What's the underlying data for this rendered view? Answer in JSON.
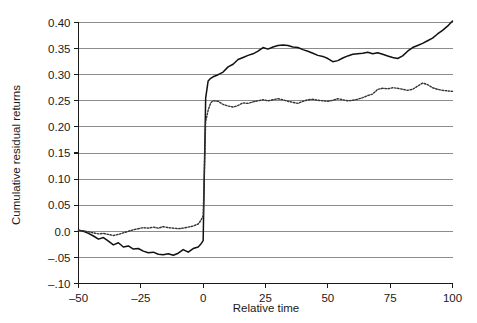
{
  "chart_data": {
    "type": "line",
    "title": "",
    "xlabel": "Relative time",
    "ylabel": "Cumulative residual returns",
    "xlim": [
      -50,
      100
    ],
    "ylim": [
      -0.1,
      0.4
    ],
    "xticks": [
      -50,
      -25,
      0,
      25,
      50,
      75,
      100
    ],
    "xtick_labels": [
      "–50",
      "–25",
      "0",
      "25",
      "50",
      "75",
      "100"
    ],
    "yticks": [
      -0.1,
      -0.05,
      0.0,
      0.05,
      0.1,
      0.15,
      0.2,
      0.25,
      0.3,
      0.35,
      0.4
    ],
    "ytick_labels": [
      "–.10",
      "–.05",
      "0.0",
      "0.05",
      "0.10",
      "0.15",
      "0.20",
      "0.25",
      "0.30",
      "0.35",
      "0.40"
    ],
    "grid": "horizontal-and-vertical-at-minus-50",
    "legend": "none",
    "accent_gridline_color": "#8c8c8c",
    "series": [
      {
        "name": "solid-series",
        "style": "solid",
        "color": "#111111",
        "x": [
          -50,
          -48,
          -46,
          -44,
          -42,
          -40,
          -38,
          -36,
          -34,
          -32,
          -30,
          -28,
          -26,
          -24,
          -22,
          -20,
          -18,
          -16,
          -14,
          -12,
          -10,
          -8,
          -6,
          -4,
          -2,
          -1,
          0,
          1,
          2,
          3,
          4,
          6,
          8,
          10,
          12,
          14,
          16,
          18,
          20,
          22,
          24,
          26,
          28,
          30,
          32,
          34,
          36,
          38,
          40,
          42,
          44,
          46,
          48,
          50,
          52,
          54,
          56,
          58,
          60,
          62,
          64,
          66,
          68,
          70,
          72,
          74,
          76,
          78,
          80,
          82,
          84,
          86,
          88,
          90,
          92,
          94,
          96,
          98,
          100
        ],
        "values": [
          0.002,
          0.0,
          -0.004,
          -0.009,
          -0.015,
          -0.012,
          -0.019,
          -0.026,
          -0.022,
          -0.03,
          -0.028,
          -0.034,
          -0.033,
          -0.038,
          -0.041,
          -0.04,
          -0.044,
          -0.045,
          -0.043,
          -0.046,
          -0.042,
          -0.035,
          -0.04,
          -0.033,
          -0.03,
          -0.025,
          -0.018,
          0.255,
          0.288,
          0.293,
          0.296,
          0.3,
          0.305,
          0.315,
          0.32,
          0.329,
          0.333,
          0.337,
          0.34,
          0.345,
          0.352,
          0.349,
          0.353,
          0.356,
          0.357,
          0.356,
          0.353,
          0.352,
          0.348,
          0.345,
          0.341,
          0.337,
          0.335,
          0.331,
          0.325,
          0.327,
          0.332,
          0.336,
          0.339,
          0.34,
          0.341,
          0.343,
          0.34,
          0.342,
          0.339,
          0.336,
          0.333,
          0.331,
          0.336,
          0.345,
          0.352,
          0.356,
          0.36,
          0.365,
          0.37,
          0.378,
          0.385,
          0.393,
          0.403
        ]
      },
      {
        "name": "dotted-series",
        "style": "dotted",
        "color": "#333333",
        "x": [
          -50,
          -48,
          -46,
          -44,
          -42,
          -40,
          -38,
          -36,
          -34,
          -32,
          -30,
          -28,
          -26,
          -24,
          -22,
          -20,
          -18,
          -16,
          -14,
          -12,
          -10,
          -8,
          -6,
          -4,
          -2,
          -1,
          0,
          1,
          2,
          3,
          4,
          6,
          8,
          10,
          12,
          14,
          16,
          18,
          20,
          22,
          24,
          26,
          28,
          30,
          32,
          34,
          36,
          38,
          40,
          42,
          44,
          46,
          48,
          50,
          52,
          54,
          56,
          58,
          60,
          62,
          64,
          66,
          68,
          70,
          72,
          74,
          76,
          78,
          80,
          82,
          84,
          86,
          88,
          90,
          92,
          94,
          96,
          98,
          100
        ],
        "values": [
          0.002,
          0.001,
          -0.001,
          -0.003,
          -0.005,
          -0.004,
          -0.006,
          -0.008,
          -0.006,
          -0.003,
          0.0,
          0.003,
          0.005,
          0.007,
          0.006,
          0.008,
          0.006,
          0.009,
          0.007,
          0.006,
          0.005,
          0.006,
          0.008,
          0.01,
          0.014,
          0.02,
          0.03,
          0.21,
          0.232,
          0.246,
          0.25,
          0.249,
          0.243,
          0.24,
          0.238,
          0.241,
          0.246,
          0.245,
          0.248,
          0.25,
          0.252,
          0.25,
          0.252,
          0.254,
          0.252,
          0.249,
          0.247,
          0.245,
          0.249,
          0.252,
          0.253,
          0.251,
          0.25,
          0.249,
          0.251,
          0.254,
          0.252,
          0.25,
          0.251,
          0.253,
          0.256,
          0.26,
          0.263,
          0.272,
          0.274,
          0.273,
          0.275,
          0.274,
          0.272,
          0.27,
          0.272,
          0.278,
          0.284,
          0.281,
          0.275,
          0.272,
          0.27,
          0.269,
          0.268
        ]
      }
    ]
  }
}
